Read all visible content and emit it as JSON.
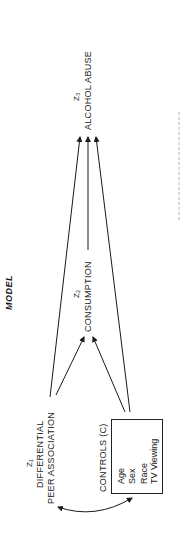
{
  "figure": {
    "title": "MODEL",
    "nodes": {
      "z1": {
        "symbol": "Z1",
        "symbol_display": "Z₁",
        "line1": "DIFFERENTIAL",
        "line2": "PEER ASSOCIATION"
      },
      "z2": {
        "symbol": "Z2",
        "symbol_display": "Z₂",
        "label": "CONSUMPTION"
      },
      "z3": {
        "symbol": "Z3",
        "symbol_display": "Z₃",
        "label": "ALCOHOL ABUSE"
      },
      "controls": {
        "label": "CONTROLS (C)",
        "items": [
          "Age",
          "Sex",
          "Race",
          "TV Viewing"
        ]
      }
    },
    "edges": [
      {
        "from": "Z1",
        "to": "Z2"
      },
      {
        "from": "Z1",
        "to": "Z3"
      },
      {
        "from": "C",
        "to": "Z2"
      },
      {
        "from": "C",
        "to": "Z3"
      },
      {
        "from": "Z2",
        "to": "Z3"
      },
      {
        "from": "Z1",
        "to": "C",
        "type": "bidirectional-curved"
      }
    ],
    "orientation": "rotated-90-ccw"
  },
  "colors": {
    "ink": "#1a1a1a",
    "background": "#ffffff"
  }
}
